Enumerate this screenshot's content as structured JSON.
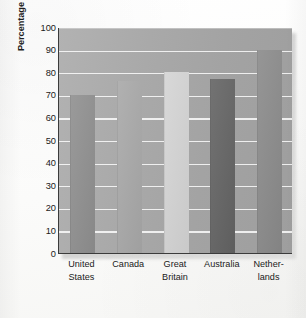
{
  "chart_data": {
    "type": "bar",
    "title": "",
    "xlabel": "",
    "ylabel": "Percentage Favoring Voluntary Active Euthanasia",
    "categories": [
      "United States",
      "Canada",
      "Great Britain",
      "Australia",
      "Netherlands"
    ],
    "category_lines": [
      [
        "United",
        "States"
      ],
      [
        "Canada",
        ""
      ],
      [
        "Great",
        "Britain"
      ],
      [
        "Australia",
        ""
      ],
      [
        "Nether-",
        "lands"
      ]
    ],
    "values": [
      70,
      76,
      80,
      77,
      90
    ],
    "ylim": [
      0,
      100
    ],
    "ytick_values": [
      0,
      10,
      20,
      30,
      40,
      50,
      60,
      70,
      80,
      90,
      100
    ],
    "ytick_labels": [
      "0",
      "10",
      "20",
      "30",
      "40",
      "50",
      "60",
      "70",
      "80",
      "90",
      "100"
    ],
    "grid": true,
    "legend": "none",
    "bar_colors": [
      "#8f8f8f",
      "#a8a8a8",
      "#d4d4d4",
      "#636363",
      "#8a8a8a"
    ],
    "plot_background": "#a9a9a9",
    "gridline_color": "#ffffff",
    "axis_color": "#3b3b3b"
  },
  "axis": {
    "y_title": "Percentage Favoring Voluntary Active Euthanasia"
  }
}
